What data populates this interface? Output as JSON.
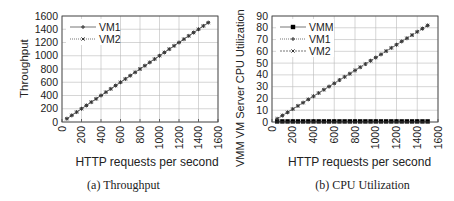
{
  "chart_data": [
    {
      "type": "line",
      "title": "(a) Throughput",
      "xlabel": "HTTP requests per second",
      "ylabel": "Throughput",
      "xlim": [
        0,
        1600
      ],
      "ylim": [
        0,
        1600
      ],
      "xticks": [
        0,
        200,
        400,
        600,
        800,
        1000,
        1200,
        1400,
        1600
      ],
      "yticks": [
        0,
        200,
        400,
        600,
        800,
        1000,
        1200,
        1400,
        1600
      ],
      "grid": true,
      "legend_position": "upper left",
      "x": [
        50,
        100,
        150,
        200,
        250,
        300,
        350,
        400,
        450,
        500,
        550,
        600,
        650,
        700,
        750,
        800,
        850,
        900,
        950,
        1000,
        1050,
        1100,
        1150,
        1200,
        1250,
        1300,
        1350,
        1400,
        1450,
        1500
      ],
      "series": [
        {
          "name": "VM1",
          "marker": "+",
          "style": "solid",
          "values": [
            50,
            100,
            150,
            200,
            250,
            300,
            350,
            400,
            450,
            500,
            550,
            600,
            650,
            700,
            750,
            800,
            850,
            900,
            950,
            1000,
            1050,
            1100,
            1150,
            1200,
            1250,
            1300,
            1350,
            1400,
            1450,
            1500
          ]
        },
        {
          "name": "VM2",
          "marker": "x",
          "style": "dotted",
          "values": [
            50,
            100,
            150,
            200,
            250,
            300,
            350,
            400,
            450,
            500,
            550,
            600,
            650,
            700,
            750,
            800,
            850,
            900,
            950,
            1000,
            1050,
            1100,
            1150,
            1200,
            1250,
            1300,
            1350,
            1400,
            1450,
            1500
          ]
        }
      ]
    },
    {
      "type": "line",
      "title": "(b) CPU Utilization",
      "xlabel": "HTTP requests per second",
      "ylabel": "VMM  VM Server CPU Utilization",
      "xlim": [
        0,
        1600
      ],
      "ylim": [
        0,
        90
      ],
      "xticks": [
        0,
        200,
        400,
        600,
        800,
        1000,
        1200,
        1400,
        1600
      ],
      "yticks": [
        0,
        10,
        20,
        30,
        40,
        50,
        60,
        70,
        80,
        90
      ],
      "grid": true,
      "legend_position": "upper left",
      "x": [
        50,
        100,
        150,
        200,
        250,
        300,
        350,
        400,
        450,
        500,
        550,
        600,
        650,
        700,
        750,
        800,
        850,
        900,
        950,
        1000,
        1050,
        1100,
        1150,
        1200,
        1250,
        1300,
        1350,
        1400,
        1450,
        1500
      ],
      "series": [
        {
          "name": "VMM",
          "marker": "square",
          "style": "solid",
          "values": [
            0.5,
            0.5,
            0.5,
            0.5,
            0.5,
            0.5,
            0.5,
            0.5,
            0.5,
            0.5,
            0.5,
            0.5,
            0.5,
            0.5,
            0.5,
            0.5,
            0.5,
            0.5,
            0.5,
            0.5,
            0.5,
            0.5,
            0.5,
            0.5,
            0.5,
            0.5,
            0.5,
            0.5,
            0.5,
            0.5
          ]
        },
        {
          "name": "VM1",
          "marker": "+",
          "style": "dotted",
          "values": [
            2.7,
            5.5,
            8.2,
            11,
            13.7,
            16.4,
            19.2,
            21.9,
            24.6,
            27.4,
            30.1,
            32.8,
            35.6,
            38.3,
            41,
            43.8,
            46.5,
            49.2,
            52,
            54.7,
            57.4,
            60.2,
            62.9,
            65.6,
            68.4,
            71.1,
            73.8,
            76.6,
            79.3,
            82
          ]
        },
        {
          "name": "VM2",
          "marker": "x",
          "style": "dashed",
          "values": [
            2.7,
            5.5,
            8.2,
            11,
            13.7,
            16.4,
            19.2,
            21.9,
            24.6,
            27.4,
            30.1,
            32.8,
            35.6,
            38.3,
            41,
            43.8,
            46.5,
            49.2,
            52,
            54.7,
            57.4,
            60.2,
            62.9,
            65.6,
            68.4,
            71.1,
            73.8,
            76.6,
            79.3,
            82
          ]
        }
      ]
    }
  ],
  "figures": {
    "a": {
      "caption": "(a) Throughput",
      "xlabel": "HTTP requests per second",
      "ylabel": "Throughput",
      "legend": [
        "VM1",
        "VM2"
      ]
    },
    "b": {
      "caption": "(b) CPU Utilization",
      "xlabel": "HTTP requests per second",
      "ylabel": "VMM  VM Server CPU Utilization",
      "legend": [
        "VMM",
        "VM1",
        "VM2"
      ]
    }
  },
  "colors": {
    "axis": "#444444",
    "grid": "#bbbbbb",
    "line": "#777777",
    "marker": "#333333",
    "vmm_marker": "#000000"
  }
}
